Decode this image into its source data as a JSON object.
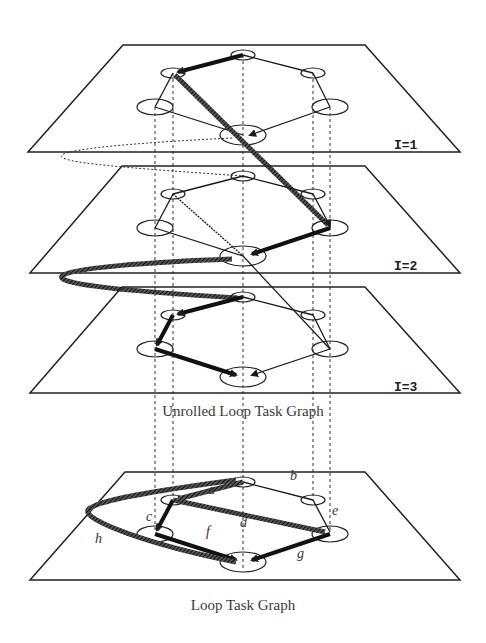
{
  "captions": {
    "unrolled": "Unrolled Loop Task Graph",
    "loop": "Loop Task Graph"
  },
  "planes": [
    {
      "id": "plane-1",
      "label": "I=1",
      "top_y": 45
    },
    {
      "id": "plane-2",
      "label": "I=2",
      "top_y": 166
    },
    {
      "id": "plane-3",
      "label": "I=3",
      "top_y": 287
    },
    {
      "id": "plane-loop",
      "label": "",
      "top_y": 472
    }
  ],
  "node_layout": {
    "top": [
      243,
      10
    ],
    "upper_left": [
      173,
      28
    ],
    "upper_right": [
      313,
      28
    ],
    "lower_left": [
      155,
      62
    ],
    "lower_right": [
      330,
      62
    ],
    "bottom": [
      243,
      90
    ]
  },
  "edge_labels": [
    {
      "text": "a",
      "x": 208,
      "y": 489
    },
    {
      "text": "b",
      "x": 290,
      "y": 475
    },
    {
      "text": "c",
      "x": 146,
      "y": 516
    },
    {
      "text": "d",
      "x": 241,
      "y": 521
    },
    {
      "text": "e",
      "x": 332,
      "y": 509
    },
    {
      "text": "f",
      "x": 206,
      "y": 530
    },
    {
      "text": "g",
      "x": 297,
      "y": 552
    },
    {
      "text": "h",
      "x": 95,
      "y": 537
    }
  ],
  "colors": {
    "line": "#1a1a1a",
    "plane": "#222222",
    "background": "#ffffff"
  }
}
